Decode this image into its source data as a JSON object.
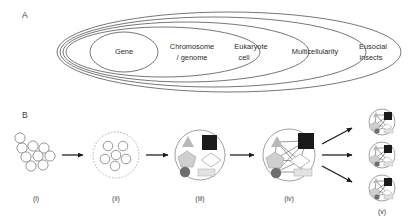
{
  "figure": {
    "panels": [
      {
        "label": "A",
        "type": "nested-ellipses",
        "description": "Nested ellipses showing hierarchical levels of biological individuality",
        "levels": [
          {
            "index": 1,
            "label": "Gene",
            "label_lines": [
              "Gene"
            ]
          },
          {
            "index": 2,
            "label": "Chromosome / genome",
            "label_lines": [
              "Chromosome",
              "/ genome"
            ]
          },
          {
            "index": 3,
            "label": "Eukaryote cell",
            "label_lines": [
              "Eukaryote",
              "cell"
            ]
          },
          {
            "index": 4,
            "label": "Multicellularity",
            "label_lines": [
              "Multicellularity"
            ]
          },
          {
            "index": 5,
            "label": "Eusocial insects",
            "label_lines": [
              "Eusocial",
              "insects"
            ]
          }
        ]
      },
      {
        "label": "B",
        "type": "process-flow",
        "description": "Five-stage evolutionary transition in individuality",
        "stages": [
          {
            "label": "(i)",
            "kind": "loose-cluster",
            "unit_count": 9
          },
          {
            "label": "(ii)",
            "kind": "bounded-group",
            "unit_count": 6,
            "boundary": "dashed"
          },
          {
            "label": "(iii)",
            "kind": "differentiated",
            "unit_count": 6,
            "boundary": "solid"
          },
          {
            "label": "(iv)",
            "kind": "integrated-network",
            "unit_count": 6,
            "boundary": "solid"
          },
          {
            "label": "(v)",
            "kind": "replicates",
            "replicate_count": 3
          }
        ],
        "arrows": [
          {
            "from": "(i)",
            "to": "(ii)",
            "direction": "right"
          },
          {
            "from": "(ii)",
            "to": "(iii)",
            "direction": "right"
          },
          {
            "from": "(iii)",
            "to": "(iv)",
            "direction": "right"
          },
          {
            "from": "(iv)",
            "to": "(v)-1",
            "direction": "up-right"
          },
          {
            "from": "(iv)",
            "to": "(v)-2",
            "direction": "right"
          },
          {
            "from": "(iv)",
            "to": "(v)-3",
            "direction": "down-right"
          }
        ],
        "shape_types": [
          {
            "name": "triangle",
            "color": "#b8b8b8"
          },
          {
            "name": "square",
            "color": "#1a1a1a"
          },
          {
            "name": "pentagon",
            "color": "#cfcfcf"
          },
          {
            "name": "diamond",
            "color": "#ffffff"
          },
          {
            "name": "circle",
            "color": "#6e6e6e"
          },
          {
            "name": "rectangle",
            "color": "#e2e2e2"
          }
        ]
      }
    ]
  },
  "colors": {
    "stroke": "#4a4a4a",
    "arrow": "#1c1c1c",
    "background": "#ffffff"
  }
}
